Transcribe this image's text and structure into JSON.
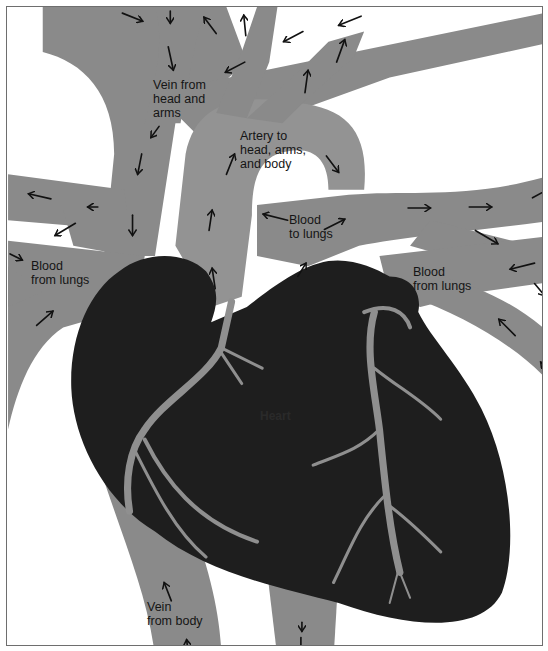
{
  "diagram": {
    "colors": {
      "vessel": "#8a8a8a",
      "heart": "#1e1e1e",
      "background": "#ffffff",
      "arrow": "#111111",
      "text": "#151515"
    },
    "labels": {
      "vein_head_arms": "Vein from\nhead and\narms",
      "artery_head_arms_body": "Artery to\nhead, arms,\nand body",
      "blood_to_lungs": "Blood\nto lungs",
      "blood_from_lungs_left": "Blood\nfrom lungs",
      "blood_from_lungs_right": "Blood\nfrom lungs",
      "vein_from_body": "Vein\nfrom body",
      "heart": "Heart"
    },
    "arrow_icon": "flow-direction-arrow"
  }
}
